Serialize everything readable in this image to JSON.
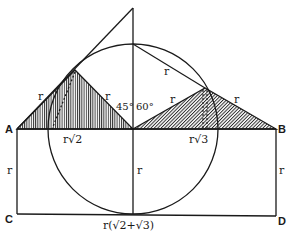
{
  "diagram": {
    "points": {
      "A": "A",
      "B": "B",
      "C": "C",
      "D": "D"
    },
    "labels": {
      "r_left_upper": "r",
      "r_center_left": "r",
      "r_chord": "r",
      "r_right_left": "r",
      "r_right_right": "r",
      "r_left_side": "r",
      "r_center_vertical": "r",
      "r_right_side": "r",
      "r_sqrt2": "r√2",
      "r_sqrt3": "r√3",
      "bottom": "r(√2+√3)",
      "angle_45": "45°",
      "angle_60": "60°"
    },
    "colors": {
      "stroke": "#1a1a1a",
      "background": "#ffffff"
    }
  }
}
